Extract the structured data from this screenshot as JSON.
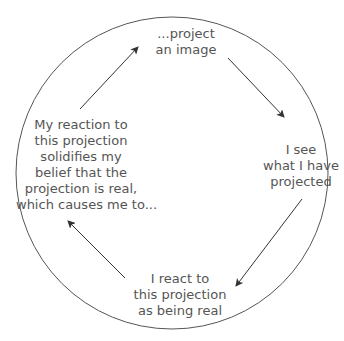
{
  "diagram": {
    "type": "cycle",
    "nodes": [
      {
        "id": "top",
        "lines": [
          "...project",
          "an image"
        ]
      },
      {
        "id": "right",
        "lines": [
          "I see",
          "what I have",
          "projected"
        ]
      },
      {
        "id": "bottom",
        "lines": [
          "I react to",
          "this projection",
          "as being real"
        ]
      },
      {
        "id": "left",
        "lines": [
          "My reaction to",
          "this projection",
          "solidifies my",
          "belief that the",
          "projection is real,",
          "which causes me to..."
        ]
      }
    ],
    "edges": [
      {
        "from": "top",
        "to": "right"
      },
      {
        "from": "right",
        "to": "bottom"
      },
      {
        "from": "bottom",
        "to": "left"
      },
      {
        "from": "left",
        "to": "top"
      }
    ],
    "colors": {
      "stroke": "#444444",
      "text": "#555555"
    }
  }
}
